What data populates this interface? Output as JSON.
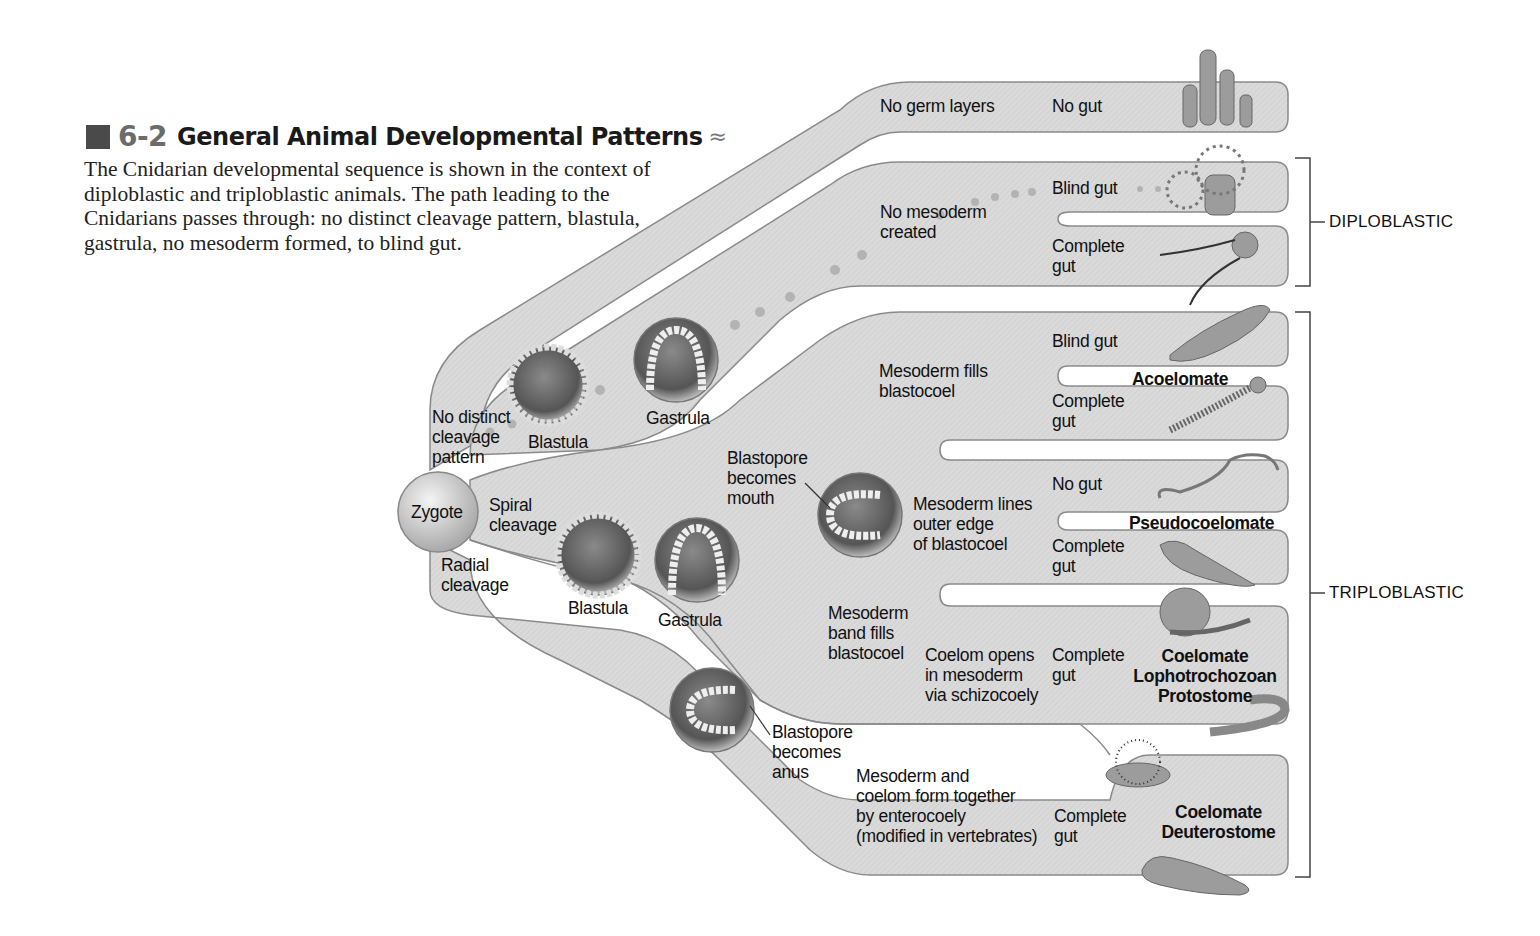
{
  "figure": {
    "number": "6-2",
    "title": "General Animal Developmental Patterns",
    "title_suffix": "≈",
    "caption": "The Cnidarian developmental sequence is shown in the context of diploblastic and triploblastic animals. The path leading to the Cnidarians passes through: no distinct cleavage pattern, blastula, gastrula, no mesoderm formed, to blind gut."
  },
  "colors": {
    "tube_fill": "#d9d9d9",
    "tube_stroke": "#8a8a8a",
    "dots": "#b0b0b0",
    "text": "#111111"
  },
  "nodes": {
    "zygote": "Zygote",
    "no_distinct_cleavage": [
      "No distinct",
      "cleavage",
      "pattern"
    ],
    "spiral_cleavage": [
      "Spiral",
      "cleavage"
    ],
    "radial_cleavage": [
      "Radial",
      "cleavage"
    ],
    "blastula_top": "Blastula",
    "gastrula_top": "Gastrula",
    "blastula_bottom": "Blastula",
    "gastrula_bottom": "Gastrula",
    "blastopore_mouth": [
      "Blastopore",
      "becomes",
      "mouth"
    ],
    "blastopore_anus": [
      "Blastopore",
      "becomes",
      "anus"
    ]
  },
  "branches": {
    "no_germ": {
      "stage": "No germ layers",
      "gut": "No gut"
    },
    "no_mesoderm": {
      "stage": [
        "No mesoderm",
        "created"
      ],
      "gut_blind": "Blind gut",
      "gut_complete": [
        "Complete",
        "gut"
      ]
    },
    "acoelomate": {
      "stage": [
        "Mesoderm fills",
        "blastocoel"
      ],
      "gut_blind": "Blind gut",
      "gut_complete": [
        "Complete",
        "gut"
      ],
      "group": "Acoelomate"
    },
    "pseudocoelomate": {
      "stage": [
        "Mesoderm lines",
        "outer edge",
        "of blastocoel"
      ],
      "gut_none": "No gut",
      "gut_complete": [
        "Complete",
        "gut"
      ],
      "group": "Pseudocoelomate"
    },
    "protostome": {
      "stage": [
        "Mesoderm",
        "band fills",
        "blastocoel"
      ],
      "coelom": [
        "Coelom opens",
        "in mesoderm",
        "via schizocoely"
      ],
      "gut": [
        "Complete",
        "gut"
      ],
      "group": [
        "Coelomate",
        "Lophotrochozoan",
        "Protostome"
      ]
    },
    "deuterostome": {
      "stage": [
        "Mesoderm and",
        "coelom form together",
        "by enterocoely",
        "(modified in vertebrates)"
      ],
      "gut": [
        "Complete",
        "gut"
      ],
      "group": [
        "Coelomate",
        "Deuterostome"
      ]
    }
  },
  "brackets": {
    "diploblastic": "DIPLOBLASTIC",
    "triploblastic": "TRIPLOBLASTIC"
  },
  "organisms": [
    "sponge-icon",
    "sea-anemone-icon",
    "comb-jelly-icon",
    "flatworm-icon",
    "ribbon-worm-icon",
    "nematode-icon",
    "rotifer-icon",
    "snail-icon",
    "earthworm-icon",
    "sea-urchin-icon",
    "seal-icon"
  ]
}
